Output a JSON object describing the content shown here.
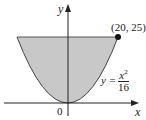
{
  "diagram": {
    "axes": {
      "x_label": "x",
      "y_label": "y",
      "origin_label": "0"
    },
    "point": {
      "label": "(20, 25)",
      "x": 20,
      "y": 25
    },
    "curve": {
      "equation_lhs": "y =",
      "numerator": "x",
      "exponent": "2",
      "denominator": "16"
    },
    "region": {
      "fill": "#c8c8c8",
      "bounded_by": "y = x^2/16 and y = 25"
    },
    "colors": {
      "axis": "#222222",
      "curve": "#333333",
      "fill": "#c8c8c8"
    }
  }
}
